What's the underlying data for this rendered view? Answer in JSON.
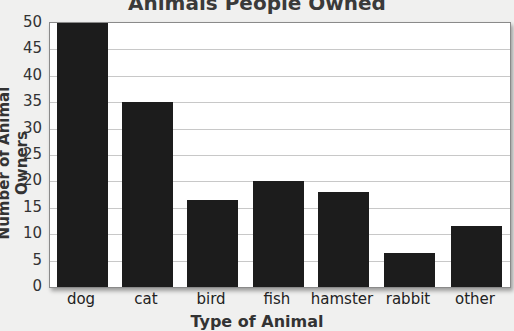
{
  "chart_data": {
    "type": "bar",
    "title": "Animals People Owned",
    "xlabel": "Type of Animal",
    "ylabel": "Number of Animal Owners",
    "categories": [
      "dog",
      "cat",
      "bird",
      "fish",
      "hamster",
      "rabbit",
      "other"
    ],
    "values": [
      50,
      35,
      16.5,
      20,
      18,
      6.5,
      11.5
    ],
    "ylim": [
      0,
      50
    ],
    "yticks": [
      "0",
      "5",
      "10",
      "15",
      "20",
      "25",
      "30",
      "35",
      "40",
      "45",
      "50"
    ],
    "grid": true,
    "legend": null,
    "bar_color": "#1c1c1c"
  }
}
